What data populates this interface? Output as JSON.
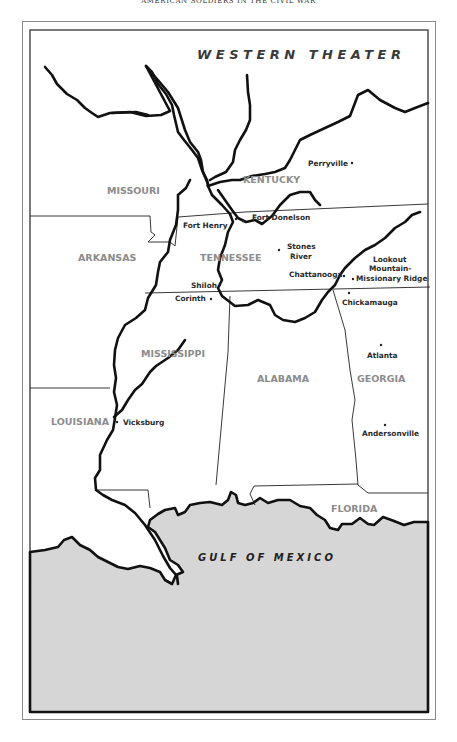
{
  "running_head": "AMERICAN SOLDIERS IN THE CIVIL WAR",
  "map": {
    "title": "WESTERN THEATER",
    "water_label": "GULF OF MEXICO",
    "colors": {
      "water": "#d6d6d6",
      "land": "#ffffff",
      "rivers": "#111111",
      "state_label": "#8c8c8c",
      "city_label": "#2a2a2a"
    },
    "states": [
      {
        "name": "MISSOURI"
      },
      {
        "name": "KENTUCKY"
      },
      {
        "name": "ARKANSAS"
      },
      {
        "name": "TENNESSEE"
      },
      {
        "name": "MISSISSIPPI"
      },
      {
        "name": "ALABAMA"
      },
      {
        "name": "GEORGIA"
      },
      {
        "name": "LOUISIANA"
      },
      {
        "name": "FLORIDA"
      }
    ],
    "places": [
      {
        "name": "Perryville"
      },
      {
        "name": "Fort Henry"
      },
      {
        "name": "Fort Donelson"
      },
      {
        "name": "Stones"
      },
      {
        "name": "River"
      },
      {
        "name": "Chattanooga"
      },
      {
        "name": "Lookout"
      },
      {
        "name": "Mountain-"
      },
      {
        "name": "Missionary Ridge"
      },
      {
        "name": "Shiloh"
      },
      {
        "name": "Corinth"
      },
      {
        "name": "Chickamauga"
      },
      {
        "name": "Atlanta"
      },
      {
        "name": "Vicksburg"
      },
      {
        "name": "Andersonville"
      }
    ]
  }
}
